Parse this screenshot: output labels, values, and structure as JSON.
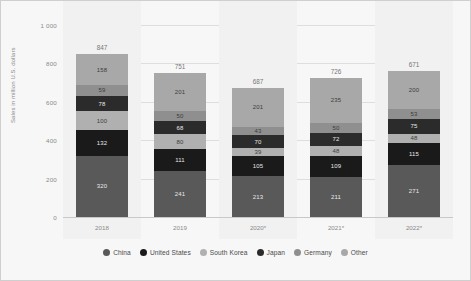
{
  "chart_data": {
    "type": "bar",
    "subtype": "stacked-vertical",
    "title": "",
    "xlabel": "",
    "ylabel": "Sales in million U.S. dollars",
    "ylim": [
      0,
      1000
    ],
    "yticks": [
      "0",
      "200",
      "400",
      "600",
      "800",
      "1 000"
    ],
    "ytick_values": [
      0,
      200,
      400,
      600,
      800,
      1000
    ],
    "grid": true,
    "legend_position": "bottom",
    "categories": [
      "2018",
      "2019",
      "2020*",
      "2021*",
      "2022*"
    ],
    "totals": [
      847,
      751,
      687,
      726,
      671
    ],
    "series": [
      {
        "name": "China",
        "color": "#595959",
        "values": [
          320,
          241,
          213,
          211,
          271
        ]
      },
      {
        "name": "United States",
        "color": "#1a1a1a",
        "values": [
          132,
          111,
          105,
          109,
          115
        ]
      },
      {
        "name": "South Korea",
        "color": "#b0b0b0",
        "values": [
          100,
          80,
          39,
          48,
          48
        ]
      },
      {
        "name": "Japan",
        "color": "#2b2b2b",
        "values": [
          78,
          68,
          70,
          72,
          75
        ]
      },
      {
        "name": "Germany",
        "color": "#8f8f8f",
        "values": [
          59,
          50,
          43,
          50,
          53
        ]
      },
      {
        "name": "Other",
        "color": "#a8a8a8",
        "values": [
          158,
          201,
          201,
          235,
          200
        ]
      }
    ]
  },
  "colors": {
    "card_background": "#f7f7f7",
    "band_background": "#f1f1f1",
    "gridline": "#dedede",
    "axis_text": "#8a8a8a",
    "total_text": "#777777",
    "legend_text": "#4a4a4a"
  }
}
